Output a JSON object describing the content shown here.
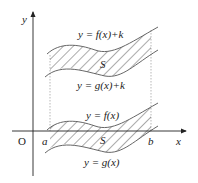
{
  "diagram": {
    "axes": {
      "x_label": "x",
      "y_label": "y",
      "origin_label": "O",
      "a_label": "a",
      "b_label": "b"
    },
    "upper_region": {
      "top_curve_label": "y = f(x)+k",
      "bottom_curve_label": "y = g(x)+k",
      "area_label": "S"
    },
    "lower_region": {
      "top_curve_label": "y = f(x)",
      "bottom_curve_label": "y = g(x)",
      "area_label": "S"
    },
    "colors": {
      "stroke": "#555555",
      "hatch": "#444444",
      "axis": "#222222",
      "dotted": "#999999"
    }
  }
}
